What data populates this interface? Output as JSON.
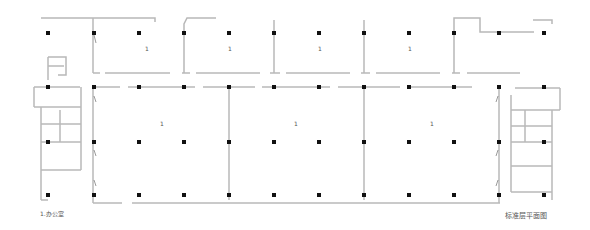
{
  "drawing": {
    "title": "标准层平面图",
    "legend": "1.办公室",
    "room_number": "1",
    "colors": {
      "wall": "#b8b8b8",
      "column": "#111111",
      "text": "#555555"
    }
  },
  "columns": {
    "x": [
      48,
      94,
      139,
      184,
      229,
      274,
      319,
      364,
      409,
      454,
      499,
      544
    ],
    "y": [
      33,
      87,
      142,
      195
    ]
  },
  "room_labels": [
    {
      "text": "1",
      "x": 147,
      "y": 50
    },
    {
      "text": "1",
      "x": 230,
      "y": 50
    },
    {
      "text": "1",
      "x": 320,
      "y": 50
    },
    {
      "text": "1",
      "x": 410,
      "y": 50
    },
    {
      "text": "1",
      "x": 162,
      "y": 124
    },
    {
      "text": "1",
      "x": 296,
      "y": 124
    },
    {
      "text": "1",
      "x": 432,
      "y": 124
    }
  ]
}
